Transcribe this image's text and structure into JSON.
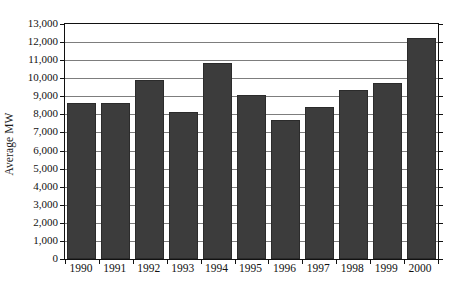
{
  "chart_data": {
    "type": "bar",
    "title": "",
    "subtitle": "",
    "xlabel": "",
    "ylabel": "Average MW",
    "categories": [
      "1990",
      "1991",
      "1992",
      "1993",
      "1994",
      "1995",
      "1996",
      "1997",
      "1998",
      "1999",
      "2000"
    ],
    "values": [
      8650,
      8650,
      9900,
      8150,
      10850,
      9100,
      7700,
      8400,
      9350,
      9750,
      12200
    ],
    "series": [
      {
        "name": "Average MW",
        "values": [
          8650,
          8650,
          9900,
          8150,
          10850,
          9100,
          7700,
          8400,
          9350,
          9750,
          12200
        ]
      }
    ],
    "ylim": [
      0,
      13000
    ],
    "ytick_values": [
      0,
      1000,
      2000,
      3000,
      4000,
      5000,
      6000,
      7000,
      8000,
      9000,
      10000,
      11000,
      12000,
      13000
    ],
    "ytick_labels": [
      "0",
      "1,000",
      "2,000",
      "3,000",
      "4,000",
      "5,000",
      "6,000",
      "7,000",
      "8,000",
      "9,000",
      "10,000",
      "11,000",
      "12,000",
      "13,000"
    ],
    "xtick_labels": [
      "1990",
      "1991",
      "1992",
      "1993",
      "1994",
      "1995",
      "1996",
      "1997",
      "1998",
      "1999",
      "2000"
    ],
    "grid": true,
    "grid_axis": "y",
    "legend": false,
    "legend_position": "none",
    "bar_color": "#3c3c3c",
    "bar_edge_color": "#2b2b2b",
    "grid_color": "#7d7d7d",
    "axis_color": "#111111",
    "background_color": "#ffffff"
  }
}
